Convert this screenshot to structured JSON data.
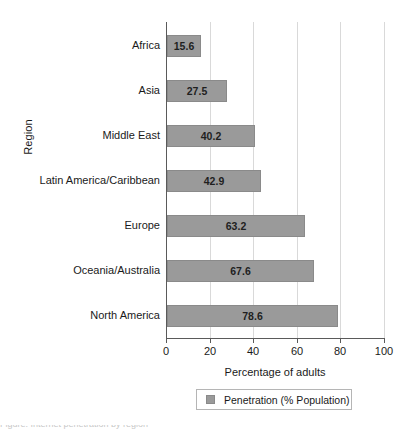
{
  "chart_data": {
    "type": "bar",
    "orientation": "horizontal",
    "title": "",
    "xlabel": "Percentage of adults",
    "ylabel": "Region",
    "xlim": [
      0,
      100
    ],
    "xticks": [
      0,
      20,
      40,
      60,
      80,
      100
    ],
    "grid": true,
    "legend_position": "bottom",
    "series_name": "Penetration (% Population)",
    "bar_color": "#9a9a9a",
    "categories": [
      "Africa",
      "Asia",
      "Middle East",
      "Latin America/Caribbean",
      "Europe",
      "Oceania/Australia",
      "North America"
    ],
    "values": [
      15.6,
      27.5,
      40.2,
      42.9,
      63.2,
      67.6,
      78.6
    ],
    "data_labels": [
      "15.6",
      "27.5",
      "40.2",
      "42.9",
      "63.2",
      "67.6",
      "78.6"
    ]
  },
  "legend": {
    "entries": [
      {
        "label": "Penetration (% Population)",
        "color": "#9a9a9a"
      }
    ]
  },
  "axes": {
    "x_title": "Percentage of adults",
    "y_title": "Region",
    "x_tick_labels": [
      "0",
      "20",
      "40",
      "60",
      "80",
      "100"
    ]
  },
  "caption": {
    "clipped_text": "Figure: Internet penetration by region"
  }
}
